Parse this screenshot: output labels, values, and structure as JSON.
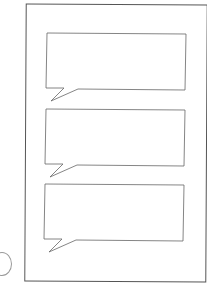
{
  "document": {
    "type": "blank speech bubble worksheet",
    "bubble_count": 3,
    "footer_lines": [
      "",
      ""
    ]
  },
  "colors": {
    "line": "#666666",
    "background": "#ffffff"
  }
}
